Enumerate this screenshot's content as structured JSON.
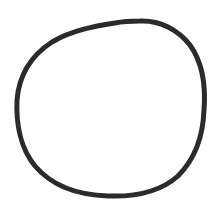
{
  "drawing": {
    "shape": "hand-drawn circle",
    "stroke_color": "#2b2b2b",
    "background_color": "#ffffff",
    "stroke_width": 5
  }
}
